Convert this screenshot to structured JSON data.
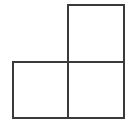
{
  "figure": {
    "name": "l-tromino-shape",
    "square_count": 3,
    "square_size_px": 56,
    "stroke_color": "#3a3a3a",
    "stroke_width_px": 2,
    "fill_color": "#ffffff",
    "background_color": "#ffffff",
    "squares": [
      {
        "label": "top-right-square",
        "x": 68,
        "y": 5,
        "w": 56,
        "h": 57
      },
      {
        "label": "bottom-left-square",
        "x": 13,
        "y": 62,
        "w": 55,
        "h": 56
      },
      {
        "label": "bottom-right-square",
        "x": 68,
        "y": 62,
        "w": 56,
        "h": 56
      }
    ],
    "outline_path": "M68,5 L124,5 L124,118 L13,118 L13,62 L68,62 Z",
    "interior_segments": [
      {
        "label": "horizontal-divider",
        "x1": 68,
        "y1": 62,
        "x2": 124,
        "y2": 62
      },
      {
        "label": "vertical-divider",
        "x1": 68,
        "y1": 62,
        "x2": 68,
        "y2": 118
      }
    ]
  }
}
